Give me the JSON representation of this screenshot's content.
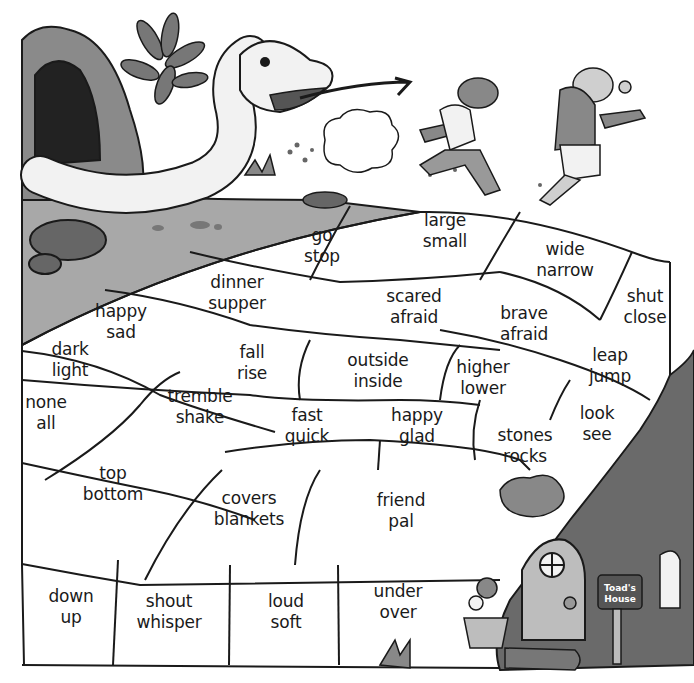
{
  "worksheet": {
    "theme": "path from the snake's cave to Toad's House",
    "mailbox_label": [
      "Toad's",
      "House"
    ],
    "tiles": [
      {
        "id": "go-stop",
        "words": [
          "go",
          "stop"
        ],
        "x": 322,
        "y": 246
      },
      {
        "id": "large-small",
        "words": [
          "large",
          "small"
        ],
        "x": 445,
        "y": 231
      },
      {
        "id": "wide-narrow",
        "words": [
          "wide",
          "narrow"
        ],
        "x": 565,
        "y": 260
      },
      {
        "id": "shut-close",
        "words": [
          "shut",
          "close"
        ],
        "x": 645,
        "y": 307
      },
      {
        "id": "dinner-supper",
        "words": [
          "dinner",
          "supper"
        ],
        "x": 237,
        "y": 293
      },
      {
        "id": "happy-sad",
        "words": [
          "happy",
          "sad"
        ],
        "x": 121,
        "y": 322
      },
      {
        "id": "scared-afraid",
        "words": [
          "scared",
          "afraid"
        ],
        "x": 414,
        "y": 307
      },
      {
        "id": "brave-afraid",
        "words": [
          "brave",
          "afraid"
        ],
        "x": 524,
        "y": 324
      },
      {
        "id": "dark-light",
        "words": [
          "dark",
          "light"
        ],
        "x": 70,
        "y": 360
      },
      {
        "id": "fall-rise",
        "words": [
          "fall",
          "rise"
        ],
        "x": 252,
        "y": 363
      },
      {
        "id": "outside-inside",
        "words": [
          "outside",
          "inside"
        ],
        "x": 378,
        "y": 371
      },
      {
        "id": "higher-lower",
        "words": [
          "higher",
          "lower"
        ],
        "x": 483,
        "y": 378
      },
      {
        "id": "leap-jump",
        "words": [
          "leap",
          "jump"
        ],
        "x": 610,
        "y": 366
      },
      {
        "id": "none-all",
        "words": [
          "none",
          "all"
        ],
        "x": 46,
        "y": 413
      },
      {
        "id": "tremble-shake",
        "words": [
          "tremble",
          "shake"
        ],
        "x": 200,
        "y": 407
      },
      {
        "id": "fast-quick",
        "words": [
          "fast",
          "quick"
        ],
        "x": 307,
        "y": 426
      },
      {
        "id": "happy-glad",
        "words": [
          "happy",
          "glad"
        ],
        "x": 417,
        "y": 426
      },
      {
        "id": "look-see",
        "words": [
          "look",
          "see"
        ],
        "x": 597,
        "y": 424
      },
      {
        "id": "stones-rocks",
        "words": [
          "stones",
          "rocks"
        ],
        "x": 525,
        "y": 446
      },
      {
        "id": "top-bottom",
        "words": [
          "top",
          "bottom"
        ],
        "x": 113,
        "y": 484
      },
      {
        "id": "covers-blankets",
        "words": [
          "covers",
          "blankets"
        ],
        "x": 249,
        "y": 509
      },
      {
        "id": "friend-pal",
        "words": [
          "friend",
          "pal"
        ],
        "x": 401,
        "y": 511
      },
      {
        "id": "down-up",
        "words": [
          "down",
          "up"
        ],
        "x": 71,
        "y": 607
      },
      {
        "id": "shout-whisper",
        "words": [
          "shout",
          "whisper"
        ],
        "x": 169,
        "y": 612
      },
      {
        "id": "loud-soft",
        "words": [
          "loud",
          "soft"
        ],
        "x": 286,
        "y": 612
      },
      {
        "id": "under-over",
        "words": [
          "under",
          "over"
        ],
        "x": 398,
        "y": 602
      }
    ]
  },
  "colors": {
    "line": "#1a1a1a",
    "ground_gray": "#a8a8a8",
    "dark_gray": "#555555",
    "mid_gray": "#7a7a7a",
    "light_gray": "#cfcfcf"
  }
}
